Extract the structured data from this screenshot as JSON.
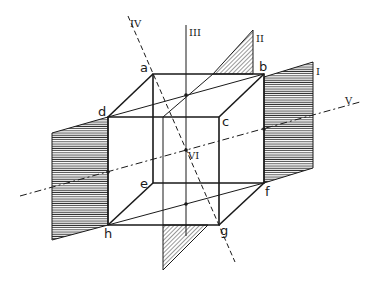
{
  "diagram": {
    "vertices": {
      "a": "a",
      "b": "b",
      "c": "c",
      "d": "d",
      "e": "e",
      "f": "f",
      "g": "g",
      "h": "h"
    },
    "planes": {
      "I": "I",
      "II": "II"
    },
    "axes": {
      "III": "III",
      "IV": "IV",
      "V": "V"
    },
    "center": "VI",
    "colors": {
      "line": "#1a1a1a",
      "hatch": "#333333",
      "background": "#ffffff"
    }
  }
}
